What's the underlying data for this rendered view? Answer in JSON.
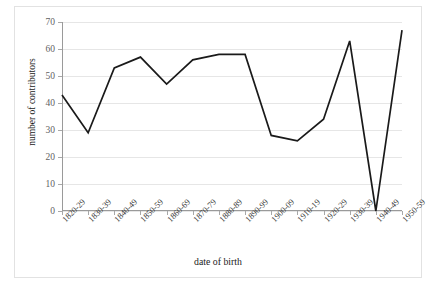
{
  "chart_data": {
    "type": "line",
    "title": "",
    "xlabel": "date of birth",
    "ylabel": "number of contributors",
    "categories": [
      "1820-29",
      "1830-39",
      "1840-49",
      "1850-59",
      "1860-69",
      "1870-79",
      "1880-89",
      "1890-99",
      "1900-09",
      "1910-19",
      "1920-29",
      "1930-39",
      "1940-49",
      "1950-59"
    ],
    "values": [
      43,
      29,
      53,
      57,
      47,
      56,
      58,
      58,
      28,
      26,
      34,
      63,
      0,
      67
    ],
    "series": [
      {
        "name": "number of contributors",
        "values": [
          43,
          29,
          53,
          57,
          47,
          56,
          58,
          58,
          28,
          26,
          34,
          63,
          0,
          67
        ]
      }
    ],
    "ylim": [
      0,
      70
    ],
    "ytick_labels": [
      "0",
      "10",
      "20",
      "30",
      "40",
      "50",
      "60",
      "70"
    ],
    "ytick_values": [
      0,
      10,
      20,
      30,
      40,
      50,
      60,
      70
    ],
    "grid": true,
    "legend": false,
    "legend_position": "none",
    "line_color": "#1a1a1a",
    "grid_color": "#e6e6e6",
    "axis_color": "#9a9a9a",
    "background_color": "#ffffff",
    "border_color": "#e2e2e2"
  }
}
